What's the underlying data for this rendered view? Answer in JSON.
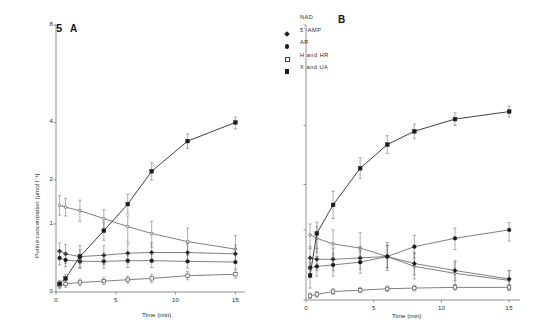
{
  "figure": {
    "number_label": "5",
    "panel_a_label": "A",
    "panel_b_label": "B"
  },
  "axes": {
    "y_title": "Purine concentration (µmol l⁻¹)",
    "x_title": "Time (min)",
    "y_ticks": [
      "0",
      "1",
      "2",
      "4",
      "8"
    ],
    "x_ticks": [
      "0",
      "5",
      "10",
      "15"
    ],
    "y_tick_values": [
      0,
      1,
      2,
      4,
      8
    ],
    "x_tick_values": [
      0,
      5,
      10,
      15
    ],
    "ylim": [
      0,
      8
    ],
    "xlim": [
      0,
      15.8
    ],
    "grid": false
  },
  "legend": {
    "position": "top-center",
    "items": [
      {
        "label": "NAD",
        "symbol": "none"
      },
      {
        "label": "5'-AMP",
        "symbol": "diamond-filled"
      },
      {
        "label": "AR",
        "symbol": "circle-filled"
      },
      {
        "label": "H and HR",
        "symbol": "square-open"
      },
      {
        "label": "X and UA",
        "symbol": "square-filled"
      }
    ]
  },
  "chart_data": {
    "type": "line",
    "title": "5",
    "xlabel": "Time (min)",
    "ylabel": "Purine concentration (µmol l⁻¹)",
    "ylim": [
      0,
      8
    ],
    "xlim": [
      0,
      15.8
    ],
    "y_scale": "nonlinear (ticks at 0,1,2,4,8)",
    "grid": false,
    "panels": [
      {
        "name": "A",
        "label": "5 A",
        "x": [
          0.3,
          0.8,
          2,
          4,
          6,
          8,
          11,
          15
        ],
        "series": [
          {
            "name": "NAD",
            "symbol": "none",
            "values": [
              1.42,
              1.38,
              1.3,
              1.12,
              0.96,
              0.86,
              0.74,
              0.63
            ],
            "errors": [
              0.22,
              0.2,
              0.24,
              0.2,
              0.22,
              0.2,
              0.2,
              0.2
            ]
          },
          {
            "name": "5'-AMP",
            "symbol": "diamond-filled",
            "values": [
              0.6,
              0.56,
              0.52,
              0.54,
              0.57,
              0.58,
              0.58,
              0.56
            ],
            "errors": [
              0.12,
              0.14,
              0.16,
              0.14,
              0.14,
              0.14,
              0.13,
              0.13
            ]
          },
          {
            "name": "AR",
            "symbol": "circle-filled",
            "values": [
              0.5,
              0.47,
              0.45,
              0.45,
              0.46,
              0.46,
              0.45,
              0.44
            ],
            "errors": [
              0.1,
              0.1,
              0.1,
              0.1,
              0.1,
              0.1,
              0.1,
              0.1
            ]
          },
          {
            "name": "H and HR",
            "symbol": "square-open",
            "values": [
              0.1,
              0.12,
              0.14,
              0.16,
              0.18,
              0.2,
              0.24,
              0.26
            ],
            "errors": [
              0.05,
              0.05,
              0.05,
              0.05,
              0.05,
              0.06,
              0.06,
              0.06
            ]
          },
          {
            "name": "X and UA",
            "symbol": "square-filled",
            "values": [
              0.12,
              0.2,
              0.52,
              0.9,
              1.45,
              2.3,
              3.35,
              4.0
            ],
            "errors": [
              0.05,
              0.06,
              0.1,
              0.14,
              0.22,
              0.3,
              0.25,
              0.22
            ]
          }
        ]
      },
      {
        "name": "B",
        "label": "B",
        "x": [
          0.3,
          0.8,
          2,
          4,
          6,
          8,
          11,
          15
        ],
        "series": [
          {
            "name": "NAD",
            "symbol": "none",
            "values": [
              0.93,
              0.88,
              0.8,
              0.74,
              0.62,
              0.48,
              0.38,
              0.28
            ],
            "errors": [
              0.2,
              0.2,
              0.2,
              0.22,
              0.2,
              0.18,
              0.16,
              0.14
            ]
          },
          {
            "name": "5'-AMP",
            "symbol": "diamond-filled",
            "values": [
              0.6,
              0.58,
              0.58,
              0.6,
              0.62,
              0.52,
              0.42,
              0.3
            ],
            "errors": [
              0.16,
              0.16,
              0.16,
              0.16,
              0.16,
              0.16,
              0.14,
              0.12
            ]
          },
          {
            "name": "AR",
            "symbol": "circle-filled",
            "values": [
              0.46,
              0.48,
              0.5,
              0.54,
              0.62,
              0.76,
              0.88,
              1.0
            ],
            "errors": [
              0.14,
              0.14,
              0.16,
              0.16,
              0.16,
              0.16,
              0.16,
              0.16
            ]
          },
          {
            "name": "H and HR",
            "symbol": "square-open",
            "values": [
              0.06,
              0.08,
              0.12,
              0.14,
              0.16,
              0.17,
              0.18,
              0.18
            ],
            "errors": [
              0.04,
              0.04,
              0.04,
              0.04,
              0.04,
              0.04,
              0.04,
              0.04
            ]
          },
          {
            "name": "X and UA",
            "symbol": "square-filled",
            "values": [
              0.35,
              0.95,
              1.55,
              2.55,
              3.35,
              3.8,
              4.25,
              4.55
            ],
            "errors": [
              0.18,
              0.22,
              0.3,
              0.35,
              0.3,
              0.25,
              0.25,
              0.22
            ]
          }
        ]
      }
    ]
  }
}
